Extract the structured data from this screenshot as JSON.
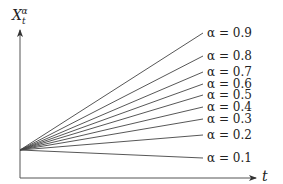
{
  "chart_data": {
    "type": "line",
    "title": "",
    "xlabel": "t",
    "ylabel": "X_t^α",
    "ylabel_main": "X",
    "ylabel_sub": "t",
    "ylabel_sup": "α",
    "grid": false,
    "legend_position": "inline-right",
    "series": [
      {
        "name": "α = 0.9",
        "alpha": 0.9,
        "end_y": 33
      },
      {
        "name": "α = 0.8",
        "alpha": 0.8,
        "end_y": 56
      },
      {
        "name": "α = 0.7",
        "alpha": 0.7,
        "end_y": 72
      },
      {
        "name": "α = 0.6",
        "alpha": 0.6,
        "end_y": 84
      },
      {
        "name": "α = 0.5",
        "alpha": 0.5,
        "end_y": 95
      },
      {
        "name": "α = 0.4",
        "alpha": 0.4,
        "end_y": 107
      },
      {
        "name": "α = 0.3",
        "alpha": 0.3,
        "end_y": 119
      },
      {
        "name": "α = 0.2",
        "alpha": 0.2,
        "end_y": 135
      },
      {
        "name": "α = 0.1",
        "alpha": 0.1,
        "end_y": 158
      }
    ],
    "origin_px": [
      20,
      150
    ],
    "line_end_x_px": 203
  }
}
